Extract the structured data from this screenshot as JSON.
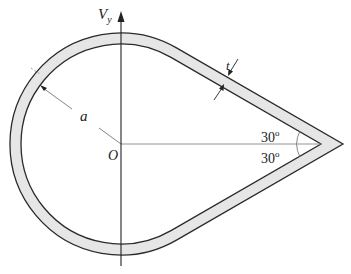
{
  "figure": {
    "type": "cross-section diagram",
    "labels": {
      "axis_label": "V",
      "axis_subscript": "y",
      "radius_label": "a",
      "origin_label": "O",
      "thickness_label": "t",
      "angle_upper": "30",
      "angle_lower": "30",
      "degree_symbol": "o"
    },
    "colors": {
      "wall_fill": "#e6e6e6",
      "wall_stroke": "#2a2a2a",
      "axis_stroke": "#222222",
      "guide_stroke": "#777777"
    }
  }
}
